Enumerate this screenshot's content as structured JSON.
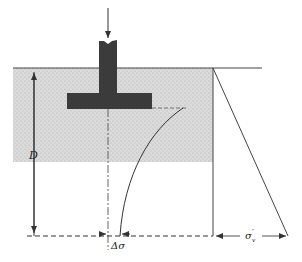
{
  "diagram": {
    "type": "footing-stress-distribution",
    "labels": {
      "depth": "D",
      "stress_increase": "Δσ",
      "effective_stress_symbol": "σ",
      "effective_stress_prime": "′",
      "effective_stress_sub": "v"
    },
    "elements": [
      "applied-load-arrow",
      "column",
      "footing",
      "ground-surface-line",
      "soil-region",
      "footing-centerline",
      "stress-increase-curve",
      "effective-stress-profile",
      "depth-dimension",
      "reference-depth-line"
    ],
    "colors": {
      "footing": "#3b3b3b",
      "soil_fill": "#d9d9d9",
      "line": "#333333",
      "background": "#ffffff"
    }
  }
}
